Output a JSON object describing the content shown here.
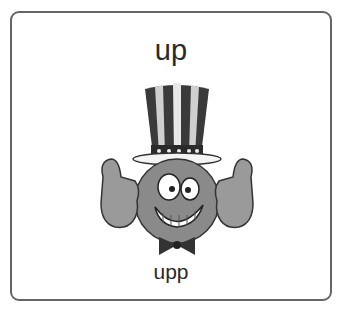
{
  "card": {
    "title": "up",
    "caption": "upp",
    "image": {
      "icon": "uncle-sam-smiley-thumbs-up-icon",
      "description": "Cartoon smiley face wearing a striped top hat with stars, giving two thumbs up, with a bow tie"
    }
  },
  "colors": {
    "border": "#666666",
    "text": "#2a2a2a",
    "background": "#ffffff"
  }
}
